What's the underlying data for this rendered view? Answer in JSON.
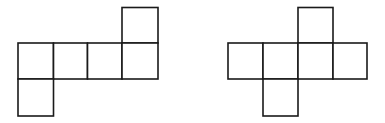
{
  "diagram": {
    "stroke_color": "#1a1a1a",
    "cell_size": 35,
    "nets": [
      {
        "name": "net-left",
        "origin": [
          18,
          8
        ],
        "cells": [
          [
            3,
            0
          ],
          [
            0,
            1
          ],
          [
            1,
            1
          ],
          [
            2,
            1
          ],
          [
            3,
            1
          ],
          [
            0,
            2
          ]
        ]
      },
      {
        "name": "net-right",
        "origin": [
          228,
          8
        ],
        "cells": [
          [
            2,
            0
          ],
          [
            0,
            1
          ],
          [
            1,
            1
          ],
          [
            2,
            1
          ],
          [
            3,
            1
          ],
          [
            1,
            2
          ]
        ]
      }
    ]
  }
}
